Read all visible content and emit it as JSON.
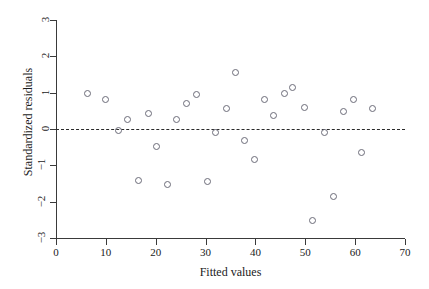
{
  "chart_data": {
    "type": "scatter",
    "title": "",
    "xlabel": "Fitted values",
    "ylabel": "Standardized residuals",
    "xlim": [
      0,
      70
    ],
    "ylim": [
      -3,
      3
    ],
    "xticks": [
      0,
      10,
      20,
      30,
      40,
      50,
      60,
      70
    ],
    "yticks": [
      3,
      2,
      1,
      0,
      -1,
      -2,
      -3
    ],
    "grid": false,
    "legend": null,
    "reference_line": {
      "type": "horizontal",
      "y": 0,
      "style": "dashed"
    },
    "marker": {
      "shape": "circle",
      "filled": false,
      "color": "#6b6b78"
    },
    "points": [
      {
        "x": 6.3,
        "y": 0.98
      },
      {
        "x": 9.9,
        "y": 0.82
      },
      {
        "x": 12.5,
        "y": -0.03
      },
      {
        "x": 14.3,
        "y": 0.27
      },
      {
        "x": 16.6,
        "y": -1.42
      },
      {
        "x": 18.6,
        "y": 0.42
      },
      {
        "x": 20.2,
        "y": -0.48
      },
      {
        "x": 22.4,
        "y": -1.52
      },
      {
        "x": 24.1,
        "y": 0.25
      },
      {
        "x": 26.2,
        "y": 0.7
      },
      {
        "x": 28.2,
        "y": 0.96
      },
      {
        "x": 30.3,
        "y": -1.44
      },
      {
        "x": 32.0,
        "y": -0.09
      },
      {
        "x": 34.1,
        "y": 0.57
      },
      {
        "x": 36.0,
        "y": 1.55
      },
      {
        "x": 37.8,
        "y": -0.32
      },
      {
        "x": 39.9,
        "y": -0.85
      },
      {
        "x": 41.8,
        "y": 0.81
      },
      {
        "x": 43.7,
        "y": 0.37
      },
      {
        "x": 45.8,
        "y": 0.99
      },
      {
        "x": 47.5,
        "y": 1.14
      },
      {
        "x": 49.8,
        "y": 0.58
      },
      {
        "x": 51.5,
        "y": -2.52
      },
      {
        "x": 53.8,
        "y": -0.09
      },
      {
        "x": 55.6,
        "y": -1.87
      },
      {
        "x": 57.7,
        "y": 0.48
      },
      {
        "x": 59.6,
        "y": 0.82
      },
      {
        "x": 61.2,
        "y": -0.65
      },
      {
        "x": 63.4,
        "y": 0.56
      }
    ]
  }
}
